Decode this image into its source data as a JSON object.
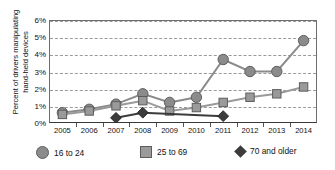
{
  "chart_data": {
    "type": "line",
    "title": "",
    "xlabel": "",
    "ylabel": "Percent of drivers manipulating hand-held devices",
    "ylabel_line1": "Percent of drivers manipulating",
    "ylabel_line2": "hand-held devices",
    "categories": [
      "2005",
      "2006",
      "2007",
      "2008",
      "2009",
      "2010",
      "2011",
      "2012",
      "2013",
      "2014"
    ],
    "x": [
      2005,
      2006,
      2007,
      2008,
      2009,
      2010,
      2011,
      2012,
      2013,
      2014
    ],
    "ylim": [
      0,
      6
    ],
    "ytick_labels": [
      "0%",
      "1%",
      "2%",
      "3%",
      "4%",
      "5%",
      "6%"
    ],
    "ytick_values": [
      0,
      1,
      2,
      3,
      4,
      5,
      6
    ],
    "grid": true,
    "legend_position": "bottom",
    "series": [
      {
        "name": "16 to 24",
        "marker": "circle",
        "color": "#8b8b8b",
        "values": [
          0.6,
          0.8,
          1.1,
          1.7,
          1.2,
          1.5,
          3.7,
          3.0,
          3.0,
          4.8
        ]
      },
      {
        "name": "25 to 69",
        "marker": "square",
        "color": "#9a9a9a",
        "values": [
          0.5,
          0.7,
          1.0,
          1.3,
          0.7,
          0.9,
          1.2,
          1.5,
          1.7,
          2.1
        ]
      },
      {
        "name": "70 and older",
        "marker": "diamond",
        "color": "#3c3c3c",
        "values": [
          null,
          null,
          0.3,
          0.6,
          null,
          null,
          0.4,
          null,
          null,
          null
        ]
      }
    ]
  },
  "legend": {
    "items": [
      {
        "label": "16 to 24",
        "marker": "circle-marker-icon"
      },
      {
        "label": "25 to 69",
        "marker": "square-marker-icon"
      },
      {
        "label": "70 and older",
        "marker": "diamond-marker-icon"
      }
    ]
  },
  "colors": {
    "circle_series": "#8b8b8b",
    "square_series": "#9a9a9a",
    "diamond_series": "#3c3c3c",
    "grid": "#9a9a9a",
    "axis": "#3a3a3a",
    "background": "#ffffff"
  }
}
